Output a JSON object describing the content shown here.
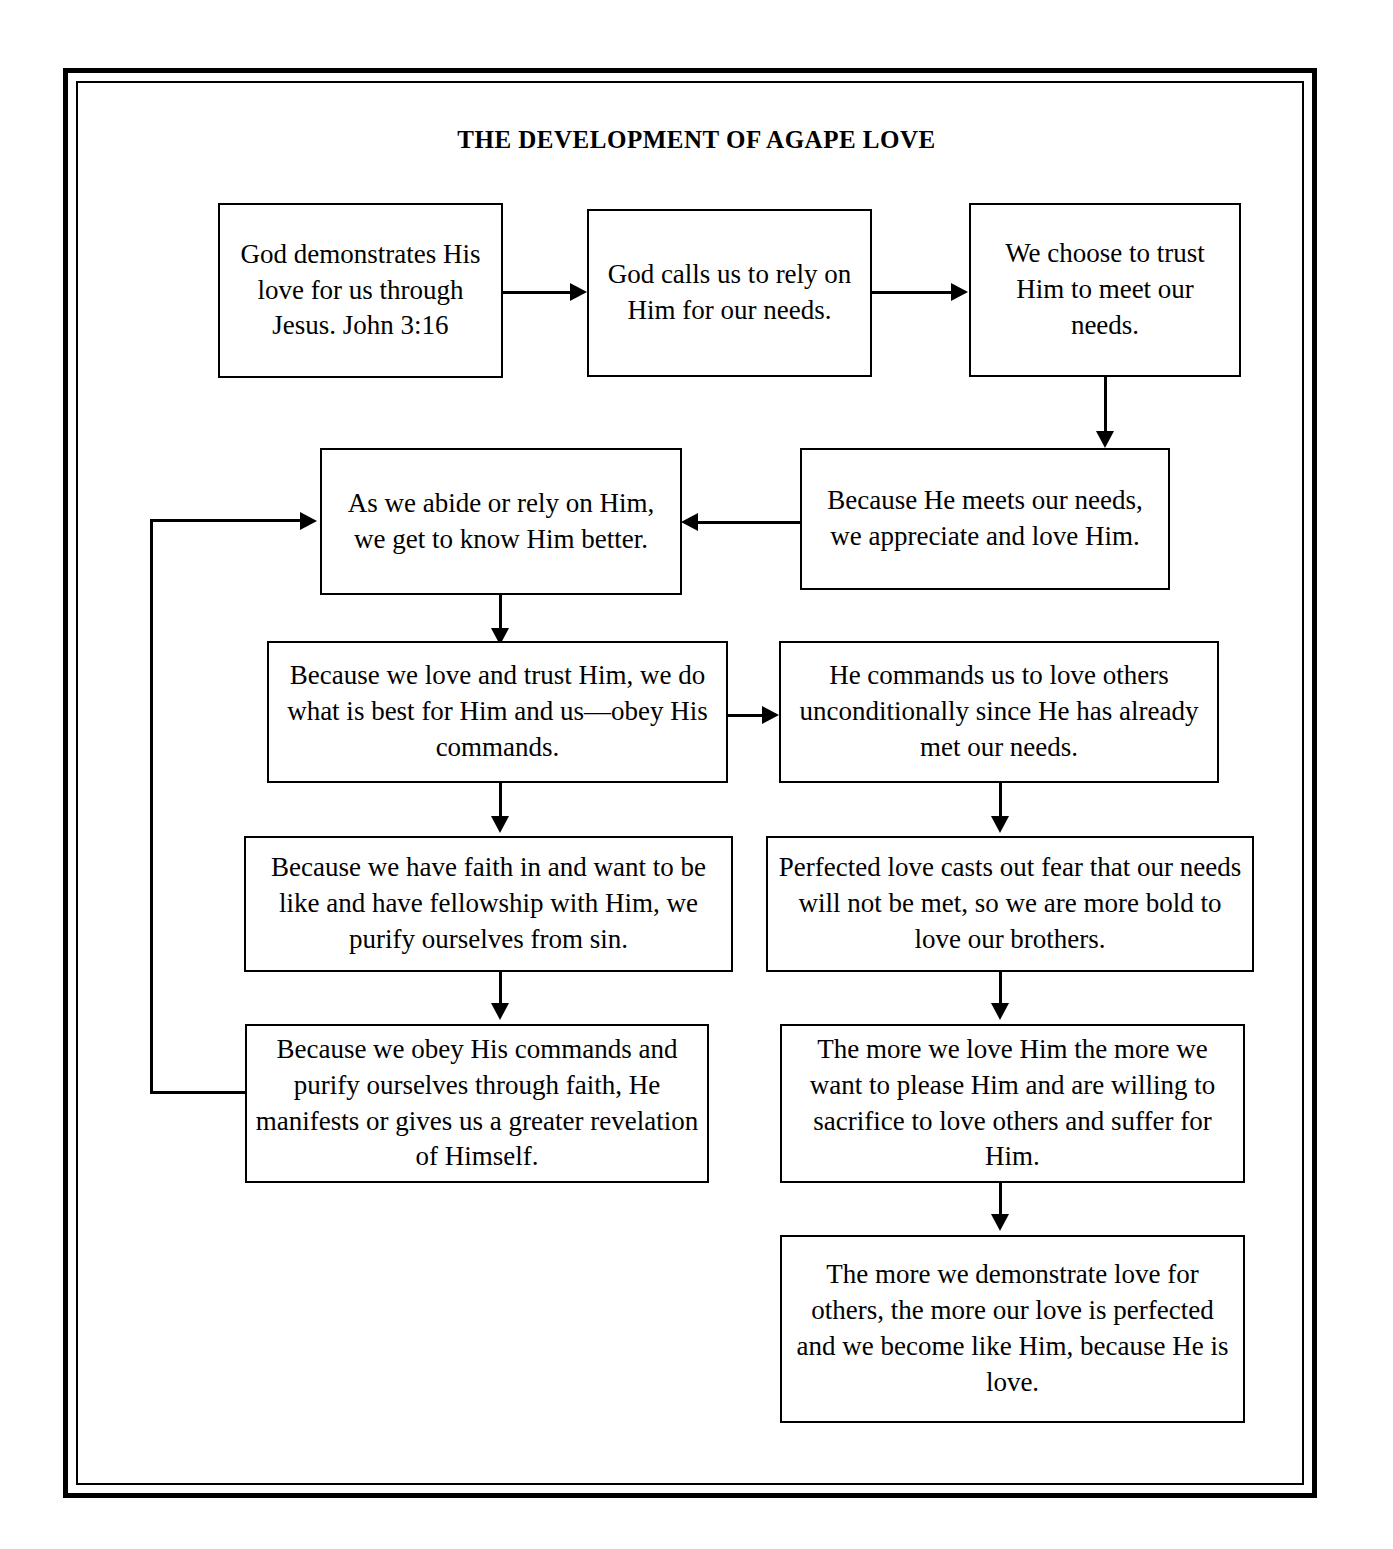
{
  "diagram": {
    "title": "THE DEVELOPMENT OF AGAPE LOVE",
    "frame_color": "#000000",
    "background_color": "#ffffff",
    "nodes": [
      {
        "id": "n1",
        "text": "God demonstrates His love for us through Jesus. John 3:16"
      },
      {
        "id": "n2",
        "text": "God calls us to rely on Him for our needs."
      },
      {
        "id": "n3",
        "text": "We choose to trust Him to meet our needs."
      },
      {
        "id": "n4",
        "text": "As we abide or rely on Him, we get to know Him better."
      },
      {
        "id": "n5",
        "text": "Because He meets our needs, we appreciate and love Him."
      },
      {
        "id": "n6",
        "text": "Because we love and trust Him, we do what is best for Him and us—obey His commands."
      },
      {
        "id": "n7",
        "text": "He commands us to love others unconditionally since He has already met our needs."
      },
      {
        "id": "n8",
        "text": "Because we have faith in and want to be like and have fellowship with Him, we purify ourselves from sin."
      },
      {
        "id": "n9",
        "text": "Perfected love casts out fear that our needs will not be met, so we are more bold to love our brothers."
      },
      {
        "id": "n10",
        "text": "Because we obey His commands and purify ourselves through faith, He manifests or gives us a greater revelation of Himself."
      },
      {
        "id": "n11",
        "text": "The more we love Him the more we want to please Him and are willing to sacrifice to love others and suffer for Him."
      },
      {
        "id": "n12",
        "text": "The more we demonstrate love for others, the more our love is perfected and we become like Him, because He is love."
      }
    ],
    "edges": [
      {
        "from": "n1",
        "to": "n2",
        "direction": "right"
      },
      {
        "from": "n2",
        "to": "n3",
        "direction": "right"
      },
      {
        "from": "n3",
        "to": "n5",
        "direction": "down"
      },
      {
        "from": "n5",
        "to": "n4",
        "direction": "left"
      },
      {
        "from": "n4",
        "to": "n6",
        "direction": "down"
      },
      {
        "from": "n6",
        "to": "n7",
        "direction": "right"
      },
      {
        "from": "n6",
        "to": "n8",
        "direction": "down"
      },
      {
        "from": "n8",
        "to": "n10",
        "direction": "down"
      },
      {
        "from": "n10",
        "to": "n4",
        "direction": "loop-left-up"
      },
      {
        "from": "n7",
        "to": "n9",
        "direction": "down"
      },
      {
        "from": "n9",
        "to": "n11",
        "direction": "down"
      },
      {
        "from": "n11",
        "to": "n12",
        "direction": "down"
      }
    ]
  }
}
